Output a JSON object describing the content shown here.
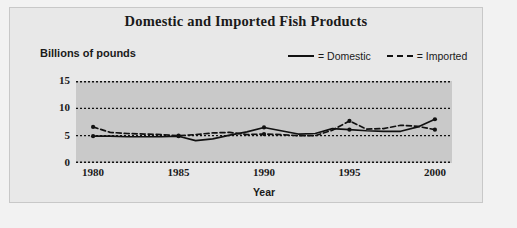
{
  "chart_data": {
    "type": "line",
    "title": "Domestic and Imported Fish Products",
    "xlabel": "Year",
    "ylabel": "Billions of pounds",
    "ylim": [
      0,
      15
    ],
    "yticks": [
      0,
      5,
      10,
      15
    ],
    "xlim": [
      1979,
      2001
    ],
    "xticks": [
      1980,
      1985,
      1990,
      1995,
      2000
    ],
    "xtick_labels": [
      "1980",
      "1985",
      "1990",
      "1995",
      "2000"
    ],
    "grid": "horizontal-dotted",
    "legend_position": "top-right",
    "legend": [
      {
        "marker": "solid-line",
        "text": "= Domestic"
      },
      {
        "marker": "dashed-line",
        "text": "= Imported"
      }
    ],
    "series": [
      {
        "name": "Domestic",
        "style": "solid",
        "x": [
          1980,
          1981,
          1982,
          1983,
          1984,
          1985,
          1986,
          1987,
          1988,
          1989,
          1990,
          1991,
          1992,
          1993,
          1994,
          1995,
          1996,
          1997,
          1998,
          1999,
          2000
        ],
        "values": [
          4.9,
          4.9,
          4.8,
          4.8,
          4.8,
          4.9,
          4.1,
          4.4,
          5.1,
          5.7,
          6.5,
          5.9,
          5.3,
          5.4,
          6.3,
          6.1,
          5.9,
          5.8,
          5.8,
          6.6,
          8.0
        ]
      },
      {
        "name": "Imported",
        "style": "dashed",
        "x": [
          1980,
          1981,
          1982,
          1983,
          1984,
          1985,
          1986,
          1987,
          1988,
          1989,
          1990,
          1991,
          1992,
          1993,
          1994,
          1995,
          1996,
          1997,
          1998,
          1999,
          2000
        ],
        "values": [
          6.6,
          5.6,
          5.4,
          5.3,
          5.2,
          5.0,
          5.2,
          5.5,
          5.6,
          5.2,
          5.3,
          5.2,
          5.0,
          5.0,
          6.0,
          7.7,
          6.2,
          6.3,
          6.9,
          6.7,
          6.1
        ]
      }
    ],
    "markers": [
      {
        "series": "Domestic",
        "x": 1980,
        "y": 4.9
      },
      {
        "series": "Domestic",
        "x": 1985,
        "y": 4.9
      },
      {
        "series": "Domestic",
        "x": 1990,
        "y": 6.5
      },
      {
        "series": "Domestic",
        "x": 1995,
        "y": 6.1
      },
      {
        "series": "Domestic",
        "x": 2000,
        "y": 8.0
      },
      {
        "series": "Imported",
        "x": 1980,
        "y": 6.6
      },
      {
        "series": "Imported",
        "x": 1985,
        "y": 5.0
      },
      {
        "series": "Imported",
        "x": 1990,
        "y": 5.3
      },
      {
        "series": "Imported",
        "x": 1995,
        "y": 7.7
      },
      {
        "series": "Imported",
        "x": 2000,
        "y": 6.1
      }
    ],
    "colors": {
      "line": "#111111",
      "plot_background": "#c9c9c9",
      "figure_background": "#e8e8e8",
      "text": "#1a1a1a"
    }
  }
}
